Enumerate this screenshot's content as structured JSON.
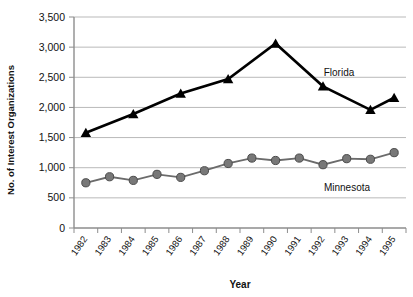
{
  "chart_data": {
    "type": "line",
    "title": "",
    "xlabel": "Year",
    "ylabel": "No. of Interest Organizations",
    "categories": [
      "1982",
      "1983",
      "1984",
      "1985",
      "1986",
      "1987",
      "1988",
      "1989",
      "1990",
      "1991",
      "1992",
      "1993",
      "1994",
      "1995"
    ],
    "ylim": [
      0,
      3500
    ],
    "ytick_labels": [
      "0",
      "500",
      "1,000",
      "1,500",
      "2,000",
      "2,500",
      "3,000",
      "3,500"
    ],
    "ytick_values": [
      0,
      500,
      1000,
      1500,
      2000,
      2500,
      3000,
      3500
    ],
    "grid": true,
    "legend_position": "inline-annotation",
    "series": [
      {
        "name": "Florida",
        "marker": "triangle",
        "color": "#000000",
        "x": [
          "1982",
          "1984",
          "1986",
          "1988",
          "1990",
          "1992",
          "1994",
          "1995"
        ],
        "values": [
          1580,
          1890,
          2230,
          2470,
          3060,
          2350,
          1960,
          2160
        ],
        "label": "Florida"
      },
      {
        "name": "Minnesota",
        "marker": "circle",
        "color": "#787878",
        "x": [
          "1982",
          "1983",
          "1984",
          "1985",
          "1986",
          "1987",
          "1988",
          "1989",
          "1990",
          "1991",
          "1992",
          "1993",
          "1994",
          "1995"
        ],
        "values": [
          750,
          850,
          790,
          890,
          840,
          950,
          1070,
          1160,
          1120,
          1160,
          1050,
          1150,
          1140,
          1250
        ],
        "label": "Minnesota"
      }
    ],
    "annotations": [
      {
        "text": "Florida",
        "series": "Florida"
      },
      {
        "text": "Minnesota",
        "series": "Minnesota"
      }
    ]
  }
}
